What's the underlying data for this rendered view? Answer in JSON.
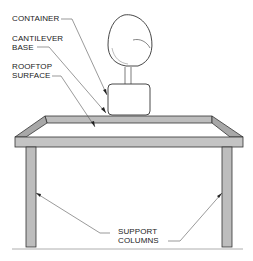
{
  "diagram": {
    "labels": {
      "container": "CONTAINER",
      "cantilever_base_1": "CANTILEVER",
      "cantilever_base_2": "BASE",
      "rooftop_surface_1": "ROOFTOP",
      "rooftop_surface_2": "SURFACE",
      "support_columns_1": "SUPPORT",
      "support_columns_2": "COLUMNS"
    },
    "colors": {
      "frame_fill": "#bdbdbd",
      "frame_side": "#a8a8a8",
      "outline": "#333333",
      "leader": "#555555"
    }
  }
}
